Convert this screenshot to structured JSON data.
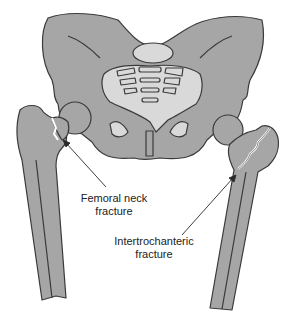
{
  "figure": {
    "colors": {
      "bone": "#a6a6a6",
      "bone_light": "#d9d9d9",
      "outline": "#3a3a3a",
      "background": "#ffffff",
      "fracture_gap": "#ffffff"
    }
  },
  "labels": {
    "femoral_neck": {
      "line1": "Femoral neck",
      "line2": "fracture"
    },
    "intertrochanteric": {
      "line1": "Intertrochanteric",
      "line2": "fracture"
    }
  },
  "caption": {
    "text": ""
  }
}
